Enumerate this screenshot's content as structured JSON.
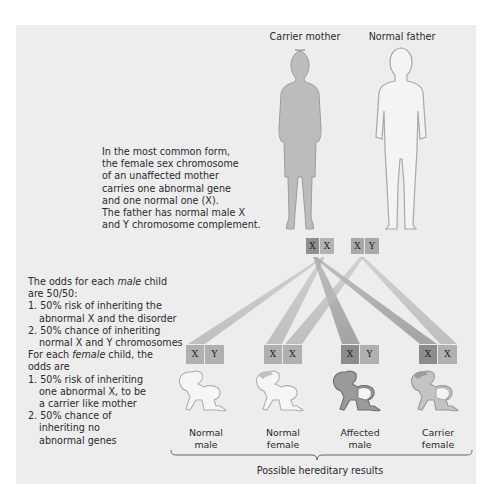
{
  "parents": {
    "mother": {
      "label": "Carrier mother",
      "chromosomes": [
        "X",
        "X"
      ],
      "chromosome_shades": [
        "#8f8f8f",
        "#b3b3b3"
      ]
    },
    "father": {
      "label": "Normal father",
      "chromosomes": [
        "X",
        "Y"
      ],
      "chromosome_shades": [
        "#a9a9a9",
        "#a9a9a9"
      ]
    }
  },
  "intro_text": {
    "lines": [
      "In the most common form,",
      "the female sex chromosome",
      "of an unaffected mother",
      "carries one abnormal gene",
      "and one normal one (X).",
      "The father has normal male X",
      "and Y chromosome complement."
    ]
  },
  "odds_text": {
    "male_heading_pre": "The odds for each ",
    "male_heading_em": "male",
    "male_heading_post": " child",
    "male_heading_line2": "are 50/50:",
    "male_items": [
      {
        "num": "1.",
        "line1": "50% risk of inheriting the",
        "line2": "abnormal X and the disorder"
      },
      {
        "num": "2.",
        "line1": "50% chance of inheriting",
        "line2": "normal X and Y chromosomes"
      }
    ],
    "female_heading_pre": "For each ",
    "female_heading_em": "female",
    "female_heading_post": " child, the",
    "female_heading_line2": "odds are",
    "female_items": [
      {
        "num": "1.",
        "line1": "50% risk of inheriting",
        "line2": "one abnormal X, to be",
        "line3": "a carrier like mother"
      },
      {
        "num": "2.",
        "line1": "50% chance of",
        "line2": "inheriting no",
        "line3": "abnormal genes"
      }
    ]
  },
  "children": [
    {
      "label_line1": "Normal",
      "label_line2": "male",
      "chromosomes": [
        "X",
        "Y"
      ],
      "shades": [
        "#b0b0b0",
        "#b0b0b0"
      ],
      "figure": "normal"
    },
    {
      "label_line1": "Normal",
      "label_line2": "female",
      "chromosomes": [
        "X",
        "X"
      ],
      "shades": [
        "#b0b0b0",
        "#b0b0b0"
      ],
      "figure": "normal"
    },
    {
      "label_line1": "Affected",
      "label_line2": "male",
      "chromosomes": [
        "X",
        "Y"
      ],
      "shades": [
        "#8c8c8c",
        "#b0b0b0"
      ],
      "figure": "affected"
    },
    {
      "label_line1": "Carrier",
      "label_line2": "female",
      "chromosomes": [
        "X",
        "X"
      ],
      "shades": [
        "#8c8c8c",
        "#b0b0b0"
      ],
      "figure": "carrier"
    }
  ],
  "footer": {
    "caption": "Possible hereditary results"
  },
  "colors": {
    "panel_bg": "#ededed",
    "mother_fill": "#bdbdbd",
    "outline": "#9a9a9a",
    "abnormal_x": "#8c8c8c",
    "normal_chrom": "#b0b0b0",
    "line_gray": "#b8b8b8"
  }
}
